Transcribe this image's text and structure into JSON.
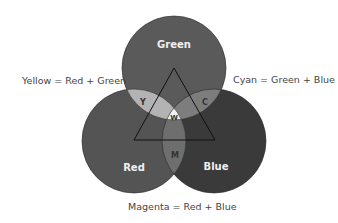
{
  "diagram": {
    "circles": [
      {
        "id": "green",
        "label": "Green",
        "cx": 174,
        "cy": 68,
        "r": 52,
        "fill": "#5a5a5a"
      },
      {
        "id": "red",
        "label": "Red",
        "cx": 134,
        "cy": 141,
        "r": 52,
        "fill": "#545454"
      },
      {
        "id": "blue",
        "label": "Blue",
        "cx": 214,
        "cy": 141,
        "r": 52,
        "fill": "#3a3a3a"
      }
    ],
    "overlaps": {
      "yellow": {
        "label": "Y",
        "fill": "#b3b3b3"
      },
      "cyan": {
        "label": "C",
        "fill": "#7d7d7d"
      },
      "magenta": {
        "label": "M",
        "fill": "#6e6e6e"
      },
      "white": {
        "label": "W",
        "fill": "#f2f2f2"
      }
    },
    "triangle": {
      "points": "174,68 134,140 215,140",
      "stroke": "#111111"
    },
    "captions": {
      "yellow": "Yellow = Red + Green",
      "cyan": "Cyan = Green + Blue",
      "magenta": "Magenta = Red + Blue"
    }
  }
}
